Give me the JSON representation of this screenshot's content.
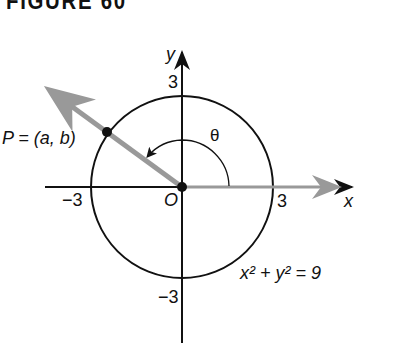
{
  "figure": {
    "title": "FIGURE 60",
    "axes": {
      "x_label": "x",
      "y_label": "y",
      "origin_label": "O",
      "x_pos_tick": "3",
      "x_neg_tick": "−3",
      "y_pos_tick": "3",
      "y_neg_tick": "−3"
    },
    "point_label": "P = (a, b)",
    "angle_label": "θ",
    "equation": "x² + y² = 9",
    "colors": {
      "ink": "#111111",
      "ray": "#999999"
    }
  }
}
